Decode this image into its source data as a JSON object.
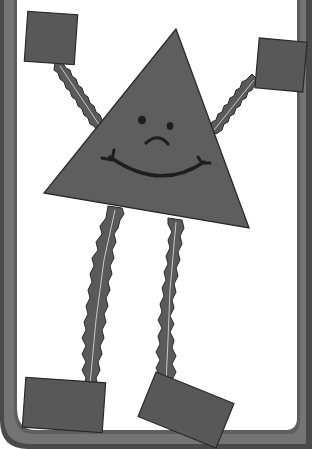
{
  "illustration": {
    "subject": "triangle character with arms and legs",
    "expression": "smile with frown brow",
    "colors": {
      "frame": "#6f6f6f",
      "frame_shadow": "#3e3e3e",
      "background": "#ffffff",
      "body": "#5e5e5e",
      "body_outline": "#2a2a2a",
      "limb": "#5a5a5a",
      "limb_vein": "#c8c8c8",
      "hand_foot": "#585858",
      "face": "#1e1e1e"
    }
  }
}
